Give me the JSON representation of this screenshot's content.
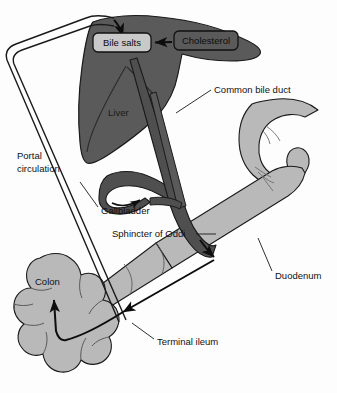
{
  "figure": {
    "background_color": "#fdfdfd"
  },
  "palette": {
    "liver": "#5a5a5a",
    "duct": "#4f4f4f",
    "intestine": "#b9b9b9",
    "outline": "#1a1a1a",
    "box_fill": "#c9c9c9",
    "box_stroke": "#111111",
    "arrow": "#0d0d0d",
    "label_text": "#111111"
  },
  "boxes": [
    {
      "id": "bile-salts",
      "label": "Bile salts",
      "x": 93,
      "y": 33,
      "width": 58,
      "height": 19
    },
    {
      "id": "cholesterol",
      "label": "Cholesterol",
      "x": 174,
      "y": 31,
      "width": 64,
      "height": 19
    }
  ],
  "labels": [
    {
      "id": "common-bile-duct",
      "text": "Common bile duct",
      "x": 214,
      "y": 90,
      "anchor": "start",
      "leader": true
    },
    {
      "id": "portal-circulation",
      "lines": [
        "Portal",
        "circulation"
      ],
      "x": 17,
      "y": 156,
      "anchor": "start",
      "leader": false
    },
    {
      "id": "liver",
      "text": "Liver",
      "x": 108,
      "y": 113,
      "anchor": "start",
      "leader": false
    },
    {
      "id": "gallbladder",
      "text": "Gallbladder",
      "x": 101,
      "y": 211,
      "anchor": "start",
      "leader": true
    },
    {
      "id": "sphincter-of-oddi",
      "text": "Sphincter of Oddi",
      "x": 112,
      "y": 234,
      "anchor": "start",
      "leader": true
    },
    {
      "id": "duodenum",
      "text": "Duodenum",
      "x": 275,
      "y": 276,
      "anchor": "start",
      "leader": true
    },
    {
      "id": "colon",
      "text": "Colon",
      "x": 35,
      "y": 282,
      "anchor": "start",
      "leader": false
    },
    {
      "id": "terminal-ileum",
      "text": "Terminal ileum",
      "x": 157,
      "y": 342,
      "anchor": "start",
      "leader": true
    }
  ],
  "structures": [
    {
      "id": "liver",
      "name": "Liver",
      "fill": "#5a5a5a"
    },
    {
      "id": "gallbladder",
      "name": "Gallbladder",
      "fill": "#5a5a5a"
    },
    {
      "id": "common-bile-duct",
      "name": "Common bile duct",
      "fill": "#4f4f4f"
    },
    {
      "id": "stomach-duodenum",
      "name": "Duodenum",
      "fill": "#b9b9b9"
    },
    {
      "id": "terminal-ileum",
      "name": "Terminal ileum",
      "fill": "#b9b9b9"
    },
    {
      "id": "colon",
      "name": "Colon",
      "fill": "#b9b9b9"
    }
  ],
  "flow_arrows": [
    {
      "id": "cholesterol-to-bile-salts",
      "from": "Cholesterol",
      "to": "Bile salts"
    },
    {
      "id": "portal-to-liver",
      "from": "Portal circulation",
      "to": "Liver"
    },
    {
      "id": "ileum-to-portal",
      "from": "Terminal ileum",
      "to": "Portal circulation"
    },
    {
      "id": "duct-to-duodenum",
      "from": "Common bile duct",
      "to": "Duodenum"
    },
    {
      "id": "duodenum-to-ileum",
      "from": "Duodenum",
      "to": "Terminal ileum"
    },
    {
      "id": "ileum-to-colon",
      "from": "Terminal ileum",
      "to": "Colon"
    }
  ]
}
